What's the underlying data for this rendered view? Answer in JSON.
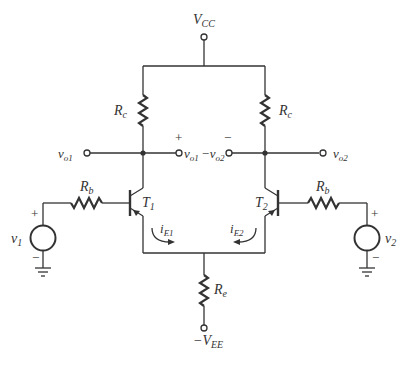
{
  "diagram": {
    "type": "circuit-schematic",
    "labels": {
      "vcc_main": "V",
      "vcc_sub": "CC",
      "vee_main": "−V",
      "vee_sub": "EE",
      "rc_left_main": "R",
      "rc_left_sub": "c",
      "rc_right_main": "R",
      "rc_right_sub": "c",
      "rb_left_main": "R",
      "rb_left_sub": "b",
      "rb_right_main": "R",
      "rb_right_sub": "b",
      "re_main": "R",
      "re_sub": "e",
      "t1_main": "T",
      "t1_sub": "1",
      "t2_main": "T",
      "t2_sub": "2",
      "vo1_left_main": "v",
      "vo1_left_sub": "o1",
      "vo1_mid_main": "v",
      "vo1_mid_sub": "o1",
      "vo2_mid_main": "−v",
      "vo2_mid_sub": "o2",
      "vo2_right_main": "v",
      "vo2_right_sub": "o2",
      "v1_main": "v",
      "v1_sub": "1",
      "v2_main": "v",
      "v2_sub": "2",
      "ie1_main": "i",
      "ie1_sub": "E1",
      "ie2_main": "i",
      "ie2_sub": "E2",
      "plus": "+",
      "minus": "−"
    },
    "colors": {
      "wire": "#333333",
      "text": "#333333",
      "background": "#ffffff"
    }
  }
}
